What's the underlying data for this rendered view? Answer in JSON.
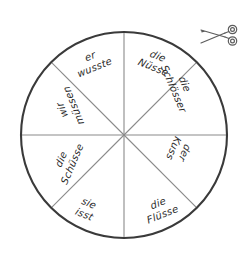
{
  "page": {
    "background_color": "#ffffff",
    "ink_color": "#2b2b2b",
    "outline_color": "#3a3a3a",
    "spoke_color": "#8a8a8a"
  },
  "wheel": {
    "name": "german-vocabulary-wheel",
    "center_x": 124,
    "center_y": 135,
    "radius": 103,
    "segment_count": 8,
    "segments": [
      {
        "id": "segment-er-wusste",
        "position": "top-left",
        "angle_deg": -22,
        "line1": "er",
        "line2": "wusste"
      },
      {
        "id": "segment-die-nuesse",
        "position": "top-right",
        "angle_deg": 22,
        "line1": "die",
        "line2": "Nüsse"
      },
      {
        "id": "segment-die-schloesser",
        "position": "right-upper",
        "angle_deg": 67,
        "line1": "die",
        "line2": "Schlösser"
      },
      {
        "id": "segment-der-kuss",
        "position": "right-lower",
        "angle_deg": 112,
        "line1": "der",
        "line2": "Kuss"
      },
      {
        "id": "segment-die-fluesse",
        "position": "bottom-right",
        "angle_deg": -22,
        "line1": "die",
        "line2": "Flüsse"
      },
      {
        "id": "segment-sie-isst",
        "position": "bottom-left",
        "angle_deg": 22,
        "line1": "sie",
        "line2": "isst"
      },
      {
        "id": "segment-die-schuesse",
        "position": "left-lower",
        "angle_deg": -67,
        "line1": "die",
        "line2": "Schüsse"
      },
      {
        "id": "segment-wir-muessen",
        "position": "left-upper",
        "angle_deg": -112,
        "line1": "wir",
        "line2": "müssen"
      }
    ]
  },
  "icons": {
    "scissors": {
      "name": "scissors-icon",
      "label": "cut out"
    }
  }
}
